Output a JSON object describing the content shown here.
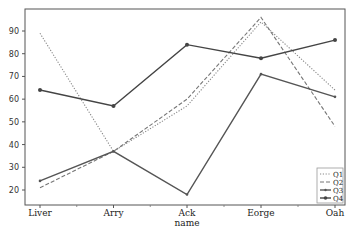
{
  "chart_data": {
    "type": "line",
    "title": "",
    "xlabel": "name",
    "ylabel": "",
    "categories": [
      "Liver",
      "Arry",
      "Ack",
      "Eorge",
      "Oah"
    ],
    "yticks": [
      20,
      30,
      40,
      50,
      60,
      70,
      80,
      90
    ],
    "ylim": [
      13,
      100
    ],
    "grid": false,
    "legend_position": "lower right",
    "series": [
      {
        "name": "Q1",
        "values": [
          89,
          37,
          57,
          94,
          64
        ],
        "style": "dotted",
        "color": "#888888",
        "marker": "none"
      },
      {
        "name": "Q2",
        "values": [
          21,
          37,
          60,
          96,
          48
        ],
        "style": "dashed",
        "color": "#777777",
        "marker": "none"
      },
      {
        "name": "Q3",
        "values": [
          24,
          37,
          18,
          71,
          61
        ],
        "style": "solid",
        "color": "#555555",
        "marker": "small"
      },
      {
        "name": "Q4",
        "values": [
          64,
          57,
          84,
          78,
          86
        ],
        "style": "solid",
        "color": "#444444",
        "marker": "dot"
      }
    ]
  }
}
